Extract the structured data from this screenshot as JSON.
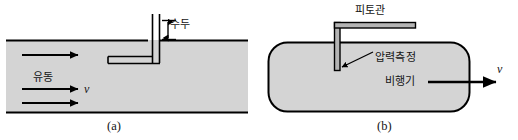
{
  "figure": {
    "panels": [
      {
        "id": "a",
        "caption": "(a)",
        "name": "pitot-tube-in-pipe-flow",
        "labels": {
          "head": "수두",
          "flow": "유동",
          "velocity": "v"
        },
        "colors": {
          "fluid_fill": "#d4d4d4",
          "line": "#000000",
          "text": "#141414",
          "background": "#ffffff"
        },
        "geometry": {
          "channel_top_y": 40,
          "channel_bottom_y": 113,
          "channel_left_x": 6,
          "channel_right_x": 248,
          "tube_vertical_x": 155,
          "tube_top_y": 14,
          "tube_elbow_y": 62,
          "tube_horizontal_left_x": 108,
          "static_port_x": 148,
          "head_arrow_top_y": 20,
          "head_arrow_bottom_y": 40,
          "flow_arrow_ys": [
            55,
            78,
            101
          ],
          "flow_arrow_x_start": 22,
          "flow_arrow_x_end": 80
        }
      },
      {
        "id": "b",
        "caption": "(b)",
        "name": "pitot-tube-on-aircraft",
        "labels": {
          "pitot_tube": "피토관",
          "pressure_measurement": "압력측정",
          "aircraft": "비행기",
          "velocity": "v"
        },
        "colors": {
          "body_fill": "#d4d4d4",
          "tube_fill": "#b8b8b8",
          "line": "#000000",
          "text": "#141414",
          "background": "#ffffff"
        },
        "geometry": {
          "body_left_x": 268,
          "body_right_x": 470,
          "body_top_y": 42,
          "body_bottom_y": 112,
          "body_corner_radius": 18,
          "tube_vertical_x": 337,
          "tube_tip_y": 70,
          "tube_elbow_y": 22,
          "tube_horizontal_right_x": 415,
          "tube_width": 5,
          "leader_from_x": 374,
          "leader_from_y": 52,
          "leader_to_x": 341,
          "leader_to_y": 68,
          "aircraft_arrow_x_start": 430,
          "aircraft_arrow_x_end": 497,
          "aircraft_arrow_y": 82
        }
      }
    ]
  }
}
